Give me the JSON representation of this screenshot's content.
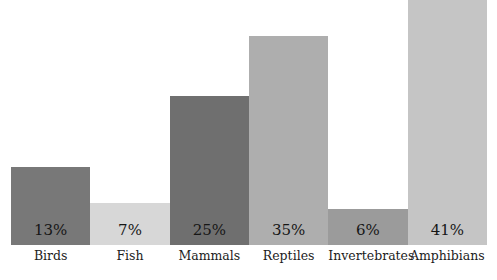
{
  "chart_data": {
    "type": "bar",
    "title": "",
    "subtitle": "",
    "xlabel": "",
    "ylabel": "",
    "ylim": [
      0,
      41
    ],
    "grid": false,
    "legend": "none",
    "orientation": "vertical",
    "bar_gap": 0,
    "value_label_position": "inside-bottom",
    "categories": [
      "Birds",
      "Fish",
      "Mammals",
      "Reptiles",
      "Invertebrates",
      "Amphibians"
    ],
    "values": [
      13,
      7,
      25,
      35,
      6,
      41
    ],
    "value_labels": [
      "13%",
      "7%",
      "25%",
      "35%",
      "6%",
      "41%"
    ],
    "colors": [
      "#787878",
      "#d7d7d7",
      "#6f6f6f",
      "#aeaeae",
      "#9b9b9b",
      "#c5c5c5"
    ],
    "bars": [
      {
        "category": "Birds",
        "value": 13,
        "label": "13%",
        "color": "#787878"
      },
      {
        "category": "Fish",
        "value": 7,
        "label": "7%",
        "color": "#d7d7d7"
      },
      {
        "category": "Mammals",
        "value": 25,
        "label": "25%",
        "color": "#6f6f6f"
      },
      {
        "category": "Reptiles",
        "value": 35,
        "label": "35%",
        "color": "#aeaeae"
      },
      {
        "category": "Invertebrates",
        "value": 6,
        "label": "6%",
        "color": "#9b9b9b"
      },
      {
        "category": "Amphibians",
        "value": 41,
        "label": "41%",
        "color": "#c5c5c5"
      }
    ]
  },
  "background_color": "#ffffff",
  "text_color": "#161616"
}
